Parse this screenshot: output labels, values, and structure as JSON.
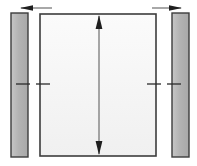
{
  "diagram": {
    "type": "engineering-dimension-diagram",
    "canvas": {
      "width": 197,
      "height": 166,
      "background": "#ffffff"
    },
    "colors": {
      "panel_fill": "#f5f5f5",
      "panel_fill_top": "#fafafa",
      "panel_stroke": "#3c3c3c",
      "bar_fill": "#b0b0b0",
      "bar_fill_light": "#c8c8c8",
      "bar_stroke": "#3c3c3c",
      "arrow": "#2b2b2b",
      "tick": "#2b2b2b"
    },
    "panel": {
      "name": "center-panel",
      "x": 40,
      "y": 14,
      "width": 116,
      "height": 142,
      "fill": "#f5f5f5",
      "stroke": "#3c3c3c",
      "stroke_width": 1.6
    },
    "left_bar": {
      "name": "left-side-member",
      "x": 11,
      "y": 13,
      "width": 17,
      "height": 144,
      "fill": "#b0b0b0",
      "stroke": "#3c3c3c",
      "stroke_width": 1.4
    },
    "right_bar": {
      "name": "right-side-member",
      "x": 172,
      "y": 13,
      "width": 17,
      "height": 144,
      "fill": "#b0b0b0",
      "stroke": "#3c3c3c",
      "stroke_width": 1.4
    },
    "vertical_dimension": {
      "name": "vertical-height-dimension",
      "x": 99,
      "y_top": 16,
      "y_bottom": 154,
      "double_headed": true,
      "head_up": true,
      "head_down": true,
      "color": "#2b2b2b",
      "label": ""
    },
    "top_left_dimension": {
      "name": "left-gap-dimension",
      "y": 8,
      "x_start": 21,
      "x_end": 52,
      "direction": "left",
      "arrow_head_at": "start",
      "color": "#2b2b2b",
      "label": ""
    },
    "top_right_dimension": {
      "name": "right-gap-dimension",
      "y": 8,
      "x_start": 152,
      "x_end": 181,
      "direction": "right",
      "arrow_head_at": "end",
      "color": "#2b2b2b",
      "label": ""
    },
    "centerline_ticks": [
      {
        "name": "tick-left-outer",
        "x1": 16,
        "x2": 30,
        "y": 84
      },
      {
        "name": "tick-left-inner",
        "x1": 36,
        "x2": 50,
        "y": 84
      },
      {
        "name": "tick-right-inner",
        "x1": 147,
        "x2": 161,
        "y": 84
      },
      {
        "name": "tick-right-outer",
        "x1": 167,
        "x2": 181,
        "y": 84
      }
    ]
  }
}
